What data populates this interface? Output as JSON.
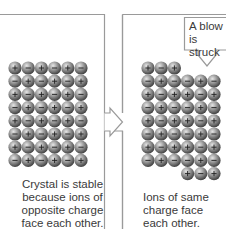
{
  "diagram": {
    "left_panel": {
      "caption": "Crystal is stable\nbecause ions of\nopposite charge\nface each other.",
      "grid": {
        "rows": 8,
        "cols": 6,
        "charges": [
          [
            "+",
            "-",
            "+",
            "-",
            "+",
            "-"
          ],
          [
            "-",
            "+",
            "-",
            "+",
            "-",
            "+"
          ],
          [
            "+",
            "-",
            "+",
            "-",
            "+",
            "-"
          ],
          [
            "-",
            "+",
            "-",
            "+",
            "-",
            "+"
          ],
          [
            "+",
            "-",
            "+",
            "-",
            "+",
            "-"
          ],
          [
            "-",
            "+",
            "-",
            "+",
            "-",
            "+"
          ],
          [
            "+",
            "-",
            "+",
            "-",
            "+",
            "-"
          ],
          [
            "-",
            "+",
            "-",
            "+",
            "-",
            "+"
          ]
        ]
      }
    },
    "right_panel": {
      "caption": "Ions of same\ncharge face\neach other.",
      "callout": "A blow\nis struck",
      "grid": {
        "rows": 8,
        "cols": 6,
        "shifted_columns": [
          3,
          4,
          5
        ],
        "shift_rows": 1
      }
    },
    "colors": {
      "frame": "#9a9a9a",
      "ion_light": "#c8c8c8",
      "ion_dark": "#4a4a4a",
      "text": "#3a3a3a"
    }
  }
}
